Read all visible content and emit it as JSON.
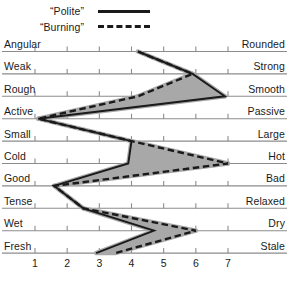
{
  "legend": {
    "items": [
      {
        "label": "“Polite”",
        "style": "solid",
        "icon": "solid-line-icon"
      },
      {
        "label": "“Burning”",
        "style": "dashed",
        "icon": "dashed-line-icon"
      }
    ]
  },
  "axis": {
    "ticks": [
      "1",
      "2",
      "3",
      "4",
      "5",
      "6",
      "7"
    ],
    "min": 1,
    "max": 7
  },
  "colors": {
    "line": "#1a1a1a",
    "band": "#a8a8a8",
    "rule": "#8c8c8c",
    "text": "#1a1a1a",
    "background": "#ffffff"
  },
  "chart_data": {
    "type": "line",
    "title": "",
    "subtitle": "",
    "xlabel": "",
    "ylabel": "",
    "xlim": [
      1,
      7
    ],
    "grid": false,
    "legend_position": "top",
    "orientation": "horizontal-semantic-differential",
    "categories": [
      "Angular – Rounded",
      "Weak – Strong",
      "Rough – Smooth",
      "Active – Passive",
      "Small – Large",
      "Cold – Hot",
      "Good – Bad",
      "Tense – Relaxed",
      "Wet – Dry",
      "Fresh – Stale"
    ],
    "left_labels": [
      "Angular",
      "Weak",
      "Rough",
      "Active",
      "Small",
      "Cold",
      "Good",
      "Tense",
      "Wet",
      "Fresh"
    ],
    "right_labels": [
      "Rounded",
      "Strong",
      "Smooth",
      "Passive",
      "Large",
      "Hot",
      "Bad",
      "Relaxed",
      "Dry",
      "Stale"
    ],
    "series": [
      {
        "name": "“Polite”",
        "style": "solid",
        "values": [
          4.2,
          5.9,
          6.9,
          1.1,
          4.0,
          3.9,
          1.6,
          2.5,
          4.7,
          2.9
        ]
      },
      {
        "name": "“Burning”",
        "style": "dashed",
        "values": [
          4.2,
          5.9,
          4.2,
          1.1,
          4.0,
          7.0,
          1.6,
          2.5,
          6.0,
          3.5
        ]
      }
    ]
  }
}
